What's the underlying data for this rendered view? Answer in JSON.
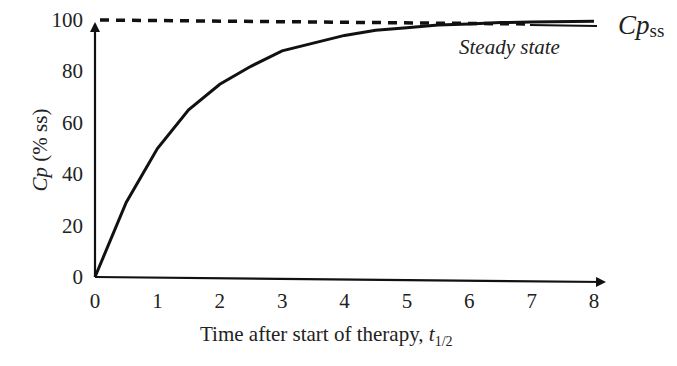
{
  "chart_data": {
    "type": "line",
    "title": "",
    "xlabel": "Time after start of therapy, t1/2",
    "xlabel_main": "Time after start of therapy, ",
    "xlabel_var": "t",
    "xlabel_sub": "1/2",
    "ylabel": "Cp (% ss)",
    "ylabel_var": "Cp",
    "ylabel_rest": " (% ss)",
    "xlim": [
      0,
      8
    ],
    "ylim": [
      0,
      100
    ],
    "x_ticks": [
      "0",
      "1",
      "2",
      "3",
      "4",
      "5",
      "6",
      "7",
      "8"
    ],
    "y_ticks": [
      "0",
      "20",
      "40",
      "60",
      "80",
      "100"
    ],
    "grid": false,
    "series": [
      {
        "name": "Cp accumulation",
        "style": "solid",
        "x": [
          0,
          0.5,
          1,
          1.5,
          2,
          2.5,
          3,
          3.5,
          4,
          4.5,
          5,
          5.5,
          6,
          6.5,
          7,
          8
        ],
        "values": [
          0,
          29,
          50,
          65,
          75,
          82,
          88,
          91,
          94,
          96,
          97,
          98,
          98.4,
          99,
          99.2,
          99.5
        ]
      },
      {
        "name": "Steady state level",
        "style": "dashed",
        "x": [
          0,
          7
        ],
        "values": [
          100,
          100
        ]
      }
    ],
    "annotations": [
      {
        "text": "Steady state",
        "style": "italic",
        "x": 6.5,
        "y": 91
      },
      {
        "text": "Cp",
        "subscript": "ss",
        "x": 8.3,
        "y": 100
      }
    ]
  },
  "labels": {
    "steady_state": "Steady state",
    "cpss_main": "Cp",
    "cpss_sub": "ss"
  }
}
